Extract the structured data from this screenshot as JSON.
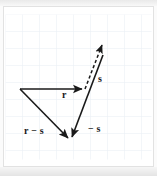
{
  "figure": {
    "background_color": "#ffffff",
    "frame_color": "#e2e2e2",
    "grid": {
      "spacing_px": 17,
      "line_color": "#e6ecf2",
      "visible": true,
      "columns": 9,
      "rows": 9
    },
    "vectors": [
      {
        "name": "r",
        "label": "r",
        "style": "solid",
        "color": "#1a1a1a",
        "from": [
          15,
          75
        ],
        "to": [
          80,
          75
        ],
        "arrowhead": "end"
      },
      {
        "name": "r-minus-s",
        "label": "r − s",
        "style": "solid",
        "color": "#1a1a1a",
        "from": [
          15,
          75
        ],
        "to": [
          65,
          127
        ],
        "arrowhead": "end"
      },
      {
        "name": "minus-s",
        "label": "− s",
        "style": "solid",
        "color": "#1a1a1a",
        "from": [
          98,
          41
        ],
        "to": [
          65,
          127
        ],
        "arrowhead": "end"
      },
      {
        "name": "s",
        "label": "s",
        "style": "dashed",
        "color": "#1a1a1a",
        "from": [
          80,
          75
        ],
        "to": [
          98,
          28
        ],
        "arrowhead": "end"
      }
    ],
    "labels": {
      "r": "r",
      "r_minus_s": "r − s",
      "minus_s": "− s",
      "s": "s"
    }
  }
}
